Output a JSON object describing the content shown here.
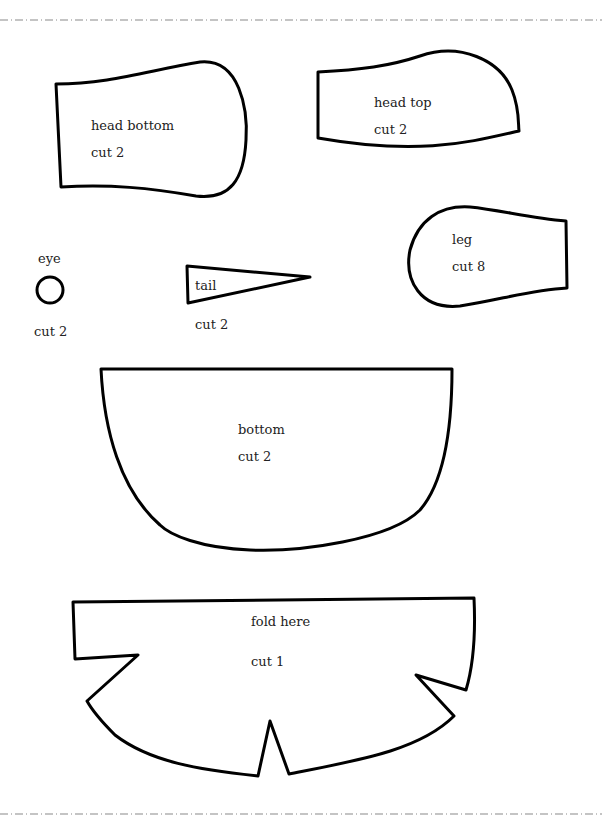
{
  "document": {
    "type": "sewing-pattern",
    "cut_line_color": "#8a8a8a",
    "outline_color": "#000000",
    "pieces": [
      {
        "id": "head-bottom",
        "name": "head bottom",
        "instruction": "cut 2"
      },
      {
        "id": "head-top",
        "name": "head top",
        "instruction": "cut 2"
      },
      {
        "id": "eye",
        "name": "eye",
        "instruction": "cut 2"
      },
      {
        "id": "tail",
        "name": "tail",
        "instruction": "cut 2"
      },
      {
        "id": "leg",
        "name": "leg",
        "instruction": "cut 8"
      },
      {
        "id": "bottom",
        "name": "bottom",
        "instruction": "cut 2"
      },
      {
        "id": "body",
        "name": "fold here",
        "instruction": "cut 1"
      }
    ]
  }
}
